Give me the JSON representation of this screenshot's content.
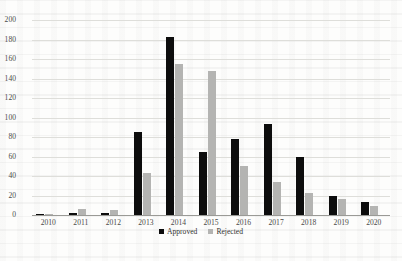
{
  "chart_data": {
    "type": "bar",
    "title": "",
    "xlabel": "",
    "ylabel": "",
    "categories": [
      "2010",
      "2011",
      "2012",
      "2013",
      "2014",
      "2015",
      "2016",
      "2017",
      "2018",
      "2019",
      "2020"
    ],
    "series": [
      {
        "name": "Approved",
        "color": "#0d0d0d",
        "values": [
          1,
          2,
          2,
          85,
          183,
          65,
          78,
          93,
          60,
          19,
          13
        ]
      },
      {
        "name": "Rejected",
        "color": "#b4b4b2",
        "values": [
          1,
          6,
          5,
          43,
          155,
          148,
          50,
          34,
          23,
          16,
          9
        ]
      }
    ],
    "ylim": [
      0,
      200
    ],
    "ytick_step": 20,
    "yticks": [
      "200",
      "180",
      "160",
      "140",
      "120",
      "100",
      "80",
      "60",
      "40",
      "20",
      "0"
    ],
    "grid": true,
    "legend_position": "bottom"
  },
  "legend": {
    "entries": [
      {
        "label": "Approved",
        "icon": "black-square-marker"
      },
      {
        "label": "Rejected",
        "icon": "gray-square-marker"
      }
    ]
  }
}
